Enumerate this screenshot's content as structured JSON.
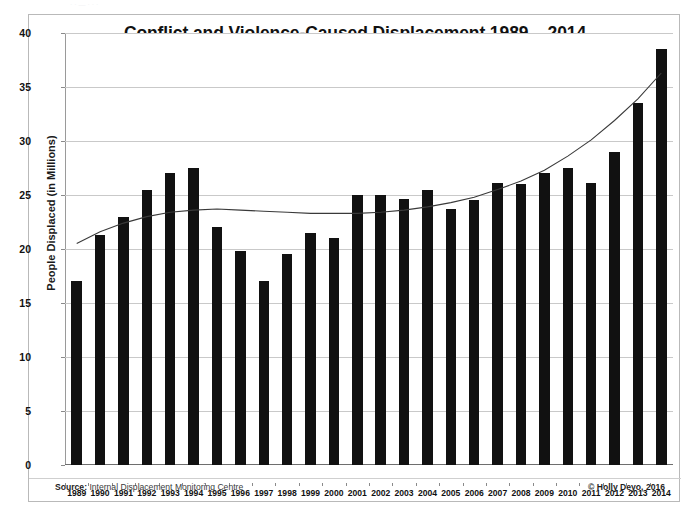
{
  "figure": {
    "scan_artifact_text": "· · — · · ·",
    "source_label": "Source:",
    "source_text": "Internal Displacement Monitoring Centre",
    "copyright": "© Holly Deyo, 2016"
  },
  "colors": {
    "bar": "#111111",
    "trendline": "#3a3a3a",
    "grid": "#c9c9c9",
    "axis": "#6e6e6e",
    "background": "#ffffff",
    "border": "#b9b9b9"
  },
  "chart_data": {
    "type": "bar",
    "title": "Conflict and Violence-Caused Displacement 1989 – 2014",
    "xlabel": "",
    "ylabel": "People Displaced (in Millions)",
    "ylim": [
      0,
      40
    ],
    "ytick_step": 5,
    "yticks": [
      0,
      5,
      10,
      15,
      20,
      25,
      30,
      35,
      40
    ],
    "ytick_labels": [
      "0",
      "5",
      "10",
      "15",
      "20",
      "25",
      "30",
      "35",
      "40"
    ],
    "grid": true,
    "legend": "none",
    "categories": [
      "1989",
      "1990",
      "1991",
      "1992",
      "1993",
      "1994",
      "1995",
      "1996",
      "1997",
      "1998",
      "1999",
      "2000",
      "2001",
      "2002",
      "2003",
      "2004",
      "2005",
      "2006",
      "2007",
      "2008",
      "2009",
      "2010",
      "2011",
      "2012",
      "2013",
      "2014"
    ],
    "values": [
      17.0,
      21.3,
      23.0,
      25.5,
      27.0,
      27.5,
      22.0,
      19.8,
      17.0,
      19.5,
      21.5,
      21.0,
      25.0,
      25.0,
      24.6,
      25.5,
      23.7,
      24.5,
      26.1,
      26.0,
      27.0,
      27.5,
      26.1,
      29.0,
      33.5,
      38.5
    ],
    "series": [
      {
        "name": "People displaced (millions)",
        "type": "bar",
        "values": [
          17.0,
          21.3,
          23.0,
          25.5,
          27.0,
          27.5,
          22.0,
          19.8,
          17.0,
          19.5,
          21.5,
          21.0,
          25.0,
          25.0,
          24.6,
          25.5,
          23.7,
          24.5,
          26.1,
          26.0,
          27.0,
          27.5,
          26.1,
          29.0,
          33.5,
          38.5
        ]
      },
      {
        "name": "Polynomial trend line",
        "type": "line",
        "values": [
          20.5,
          21.6,
          22.4,
          23.0,
          23.4,
          23.6,
          23.7,
          23.6,
          23.5,
          23.4,
          23.3,
          23.3,
          23.3,
          23.4,
          23.6,
          23.9,
          24.3,
          24.8,
          25.5,
          26.3,
          27.3,
          28.6,
          30.1,
          31.9,
          33.9,
          36.3
        ]
      }
    ]
  }
}
